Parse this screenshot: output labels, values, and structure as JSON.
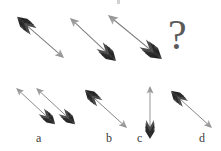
{
  "puzzle": {
    "type": "visual-analogy-arrow-sequence",
    "canvas": {
      "width": 221,
      "height": 151,
      "background": "#ffffff"
    },
    "palette": {
      "fletching_dark": "#2e2e2e",
      "fletching_mid": "#6e6e6e",
      "shaft": "#7c7c7c",
      "arrowhead": "#9a9a9a",
      "label_text": "#3b3b3b",
      "question_mark": "#5a5a5a"
    },
    "question_mark": {
      "glyph": "?",
      "x": 168,
      "y": 14
    },
    "sequence": {
      "name": "prompt-row",
      "items": [
        {
          "id": "prompt-1",
          "direction": "down-right",
          "tail": {
            "x": 16,
            "y": 16
          },
          "head": {
            "x": 64,
            "y": 58
          },
          "fletching_at": "tail"
        },
        {
          "id": "prompt-2",
          "direction": "up-left",
          "tail": {
            "x": 117,
            "y": 62
          },
          "head": {
            "x": 70,
            "y": 18
          },
          "fletching_at": "tail"
        },
        {
          "id": "prompt-3",
          "direction": "up-left",
          "tail": {
            "x": 163,
            "y": 60
          },
          "head": {
            "x": 108,
            "y": 15
          },
          "fletching_at": "tail"
        },
        {
          "id": "prompt-4",
          "direction": "unknown",
          "is_question": true
        }
      ]
    },
    "options": {
      "name": "answer-row",
      "items": [
        {
          "key": "a",
          "label": "a",
          "label_x": 36,
          "label_y": 132,
          "arrow_count": 2,
          "arrows": [
            {
              "direction": "up-left",
              "tail": {
                "x": 56,
                "y": 125
              },
              "head": {
                "x": 16,
                "y": 88
              },
              "fletching_at": "tail"
            },
            {
              "direction": "up-left",
              "tail": {
                "x": 76,
                "y": 125
              },
              "head": {
                "x": 36,
                "y": 88
              },
              "fletching_at": "tail"
            }
          ]
        },
        {
          "key": "b",
          "label": "b",
          "label_x": 106,
          "label_y": 132,
          "arrow_count": 1,
          "arrows": [
            {
              "direction": "down-right",
              "tail": {
                "x": 84,
                "y": 89
              },
              "head": {
                "x": 127,
                "y": 128
              },
              "fletching_at": "tail"
            }
          ]
        },
        {
          "key": "c",
          "label": "c",
          "label_x": 137,
          "label_y": 132,
          "arrow_count": 1,
          "arrows": [
            {
              "direction": "up",
              "tail": {
                "x": 150,
                "y": 140
              },
              "head": {
                "x": 150,
                "y": 86
              },
              "fletching_at": "tail"
            }
          ]
        },
        {
          "key": "d",
          "label": "d",
          "label_x": 199,
          "label_y": 132,
          "arrow_count": 1,
          "arrows": [
            {
              "direction": "down-right",
              "tail": {
                "x": 170,
                "y": 90
              },
              "head": {
                "x": 212,
                "y": 128
              },
              "fletching_at": "tail"
            }
          ]
        }
      ]
    }
  }
}
